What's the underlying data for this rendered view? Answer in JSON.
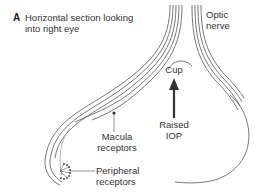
{
  "panel": {
    "letter": "A",
    "title_line1": "Horizontal section looking",
    "title_line2": "into right eye"
  },
  "labels": {
    "optic_nerve_1": "Optic",
    "optic_nerve_2": "nerve",
    "cup": "Cup",
    "raised_iop_1": "Raised",
    "raised_iop_2": "IOP",
    "macula_1": "Macula",
    "macula_2": "receptors",
    "peripheral_1": "Peripheral",
    "peripheral_2": "receptors"
  },
  "colors": {
    "line": "#555555",
    "arrow": "#333333",
    "text": "#333333"
  }
}
